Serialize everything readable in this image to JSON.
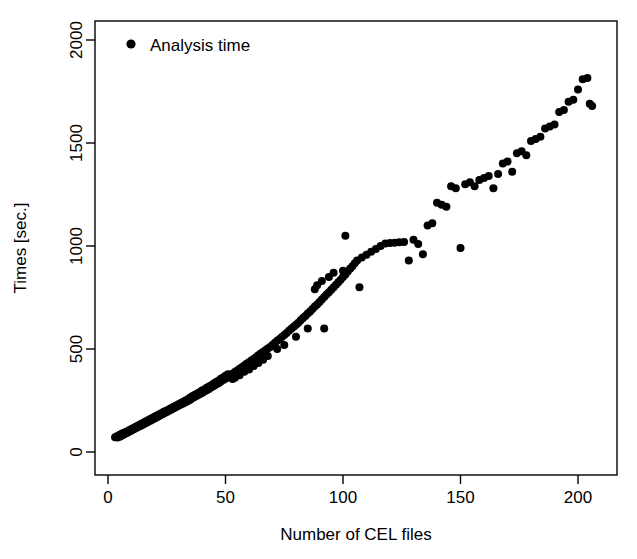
{
  "chart_data": {
    "type": "scatter",
    "title": "",
    "xlabel": "Number of CEL files",
    "ylabel": "Times [sec.]",
    "xlim": [
      -3,
      218
    ],
    "ylim": [
      -60,
      2060
    ],
    "xticks": [
      0,
      50,
      100,
      150,
      200
    ],
    "yticks": [
      0,
      500,
      1000,
      1500,
      2000
    ],
    "xtick_labels": [
      "0",
      "50",
      "100",
      "150",
      "200"
    ],
    "ytick_labels": [
      "0",
      "500",
      "1000",
      "1500",
      "2000"
    ],
    "grid": false,
    "legend_position": "top-left",
    "marker_color": "#000000",
    "marker_size": 8,
    "series": [
      {
        "name": "Analysis time",
        "points": [
          [
            3,
            72
          ],
          [
            4,
            70
          ],
          [
            4,
            78
          ],
          [
            5,
            74
          ],
          [
            5,
            84
          ],
          [
            6,
            80
          ],
          [
            6,
            90
          ],
          [
            7,
            86
          ],
          [
            7,
            95
          ],
          [
            8,
            92
          ],
          [
            8,
            100
          ],
          [
            9,
            98
          ],
          [
            9,
            106
          ],
          [
            10,
            104
          ],
          [
            10,
            112
          ],
          [
            11,
            110
          ],
          [
            11,
            118
          ],
          [
            12,
            116
          ],
          [
            12,
            124
          ],
          [
            13,
            122
          ],
          [
            13,
            130
          ],
          [
            14,
            128
          ],
          [
            14,
            136
          ],
          [
            15,
            134
          ],
          [
            15,
            142
          ],
          [
            16,
            140
          ],
          [
            16,
            148
          ],
          [
            17,
            146
          ],
          [
            17,
            154
          ],
          [
            18,
            152
          ],
          [
            18,
            160
          ],
          [
            19,
            158
          ],
          [
            19,
            166
          ],
          [
            20,
            164
          ],
          [
            20,
            172
          ],
          [
            21,
            170
          ],
          [
            21,
            178
          ],
          [
            22,
            176
          ],
          [
            22,
            184
          ],
          [
            23,
            182
          ],
          [
            23,
            190
          ],
          [
            24,
            188
          ],
          [
            24,
            196
          ],
          [
            25,
            194
          ],
          [
            25,
            202
          ],
          [
            26,
            200
          ],
          [
            26,
            208
          ],
          [
            27,
            206
          ],
          [
            27,
            214
          ],
          [
            28,
            212
          ],
          [
            28,
            220
          ],
          [
            29,
            218
          ],
          [
            29,
            226
          ],
          [
            30,
            224
          ],
          [
            30,
            232
          ],
          [
            31,
            230
          ],
          [
            31,
            238
          ],
          [
            32,
            236
          ],
          [
            32,
            244
          ],
          [
            33,
            242
          ],
          [
            33,
            250
          ],
          [
            34,
            248
          ],
          [
            34,
            256
          ],
          [
            35,
            254
          ],
          [
            35,
            264
          ],
          [
            36,
            262
          ],
          [
            36,
            272
          ],
          [
            37,
            268
          ],
          [
            37,
            278
          ],
          [
            38,
            274
          ],
          [
            38,
            284
          ],
          [
            39,
            280
          ],
          [
            39,
            290
          ],
          [
            40,
            286
          ],
          [
            40,
            298
          ],
          [
            41,
            294
          ],
          [
            41,
            304
          ],
          [
            42,
            300
          ],
          [
            42,
            312
          ],
          [
            43,
            306
          ],
          [
            43,
            318
          ],
          [
            44,
            314
          ],
          [
            44,
            324
          ],
          [
            45,
            320
          ],
          [
            45,
            332
          ],
          [
            46,
            328
          ],
          [
            46,
            340
          ],
          [
            47,
            334
          ],
          [
            47,
            346
          ],
          [
            48,
            342
          ],
          [
            48,
            356
          ],
          [
            49,
            350
          ],
          [
            49,
            362
          ],
          [
            50,
            356
          ],
          [
            50,
            370
          ],
          [
            51,
            364
          ],
          [
            51,
            378
          ],
          [
            52,
            372
          ],
          [
            53,
            380
          ],
          [
            53,
            354
          ],
          [
            54,
            388
          ],
          [
            54,
            360
          ],
          [
            55,
            396
          ],
          [
            56,
            404
          ],
          [
            56,
            372
          ],
          [
            57,
            412
          ],
          [
            58,
            420
          ],
          [
            58,
            390
          ],
          [
            59,
            428
          ],
          [
            60,
            436
          ],
          [
            60,
            400
          ],
          [
            61,
            444
          ],
          [
            62,
            452
          ],
          [
            62,
            418
          ],
          [
            63,
            460
          ],
          [
            64,
            470
          ],
          [
            64,
            432
          ],
          [
            65,
            478
          ],
          [
            66,
            486
          ],
          [
            66,
            448
          ],
          [
            67,
            494
          ],
          [
            68,
            502
          ],
          [
            68,
            466
          ],
          [
            69,
            510
          ],
          [
            70,
            520
          ],
          [
            71,
            530
          ],
          [
            72,
            540
          ],
          [
            72,
            500
          ],
          [
            73,
            548
          ],
          [
            74,
            558
          ],
          [
            75,
            568
          ],
          [
            75,
            520
          ],
          [
            76,
            578
          ],
          [
            77,
            588
          ],
          [
            78,
            598
          ],
          [
            79,
            608
          ],
          [
            80,
            618
          ],
          [
            80,
            560
          ],
          [
            81,
            628
          ],
          [
            82,
            640
          ],
          [
            83,
            650
          ],
          [
            84,
            660
          ],
          [
            85,
            672
          ],
          [
            85,
            600
          ],
          [
            86,
            682
          ],
          [
            87,
            694
          ],
          [
            88,
            706
          ],
          [
            88,
            790
          ],
          [
            89,
            716
          ],
          [
            89,
            810
          ],
          [
            90,
            728
          ],
          [
            91,
            740
          ],
          [
            91,
            830
          ],
          [
            92,
            752
          ],
          [
            92,
            600
          ],
          [
            93,
            764
          ],
          [
            94,
            776
          ],
          [
            94,
            850
          ],
          [
            95,
            788
          ],
          [
            96,
            800
          ],
          [
            96,
            870
          ],
          [
            97,
            812
          ],
          [
            98,
            824
          ],
          [
            99,
            836
          ],
          [
            100,
            850
          ],
          [
            100,
            880
          ],
          [
            101,
            862
          ],
          [
            101,
            1050
          ],
          [
            102,
            876
          ],
          [
            103,
            890
          ],
          [
            104,
            902
          ],
          [
            105,
            916
          ],
          [
            106,
            930
          ],
          [
            107,
            800
          ],
          [
            108,
            944
          ],
          [
            110,
            958
          ],
          [
            112,
            972
          ],
          [
            114,
            986
          ],
          [
            116,
            1000
          ],
          [
            118,
            1012
          ],
          [
            120,
            1014
          ],
          [
            122,
            1016
          ],
          [
            124,
            1018
          ],
          [
            126,
            1020
          ],
          [
            128,
            930
          ],
          [
            130,
            1030
          ],
          [
            132,
            1010
          ],
          [
            134,
            960
          ],
          [
            136,
            1100
          ],
          [
            138,
            1110
          ],
          [
            140,
            1210
          ],
          [
            142,
            1200
          ],
          [
            144,
            1190
          ],
          [
            146,
            1290
          ],
          [
            148,
            1280
          ],
          [
            150,
            990
          ],
          [
            152,
            1300
          ],
          [
            154,
            1310
          ],
          [
            156,
            1290
          ],
          [
            158,
            1320
          ],
          [
            160,
            1330
          ],
          [
            162,
            1340
          ],
          [
            164,
            1280
          ],
          [
            166,
            1350
          ],
          [
            168,
            1400
          ],
          [
            170,
            1410
          ],
          [
            172,
            1360
          ],
          [
            174,
            1450
          ],
          [
            176,
            1460
          ],
          [
            178,
            1440
          ],
          [
            180,
            1510
          ],
          [
            182,
            1520
          ],
          [
            184,
            1530
          ],
          [
            186,
            1570
          ],
          [
            188,
            1580
          ],
          [
            190,
            1590
          ],
          [
            192,
            1650
          ],
          [
            194,
            1660
          ],
          [
            196,
            1700
          ],
          [
            198,
            1710
          ],
          [
            200,
            1760
          ],
          [
            202,
            1810
          ],
          [
            204,
            1815
          ],
          [
            205,
            1690
          ],
          [
            206,
            1680
          ]
        ]
      }
    ]
  },
  "legend": {
    "entries": [
      {
        "label": "Analysis time",
        "marker": "filled-circle",
        "color": "#000000"
      }
    ]
  },
  "axes": {
    "x_axis_label": "Number of CEL files",
    "y_axis_label": "Times [sec.]"
  }
}
